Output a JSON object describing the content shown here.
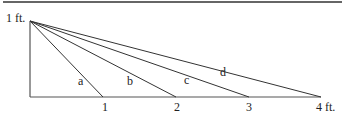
{
  "diagram": {
    "height_label": "1 ft.",
    "base_labels": [
      "1",
      "2",
      "3",
      "4 ft."
    ],
    "segment_labels": [
      "a",
      "b",
      "c",
      "d"
    ],
    "line_color": "#333333"
  }
}
